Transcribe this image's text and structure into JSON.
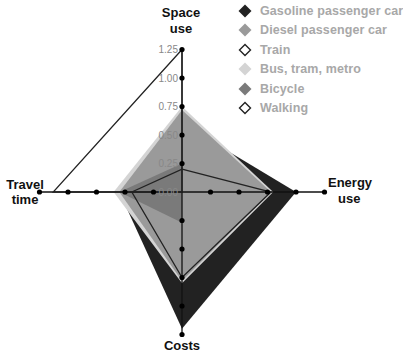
{
  "chart_data": {
    "type": "radar",
    "title": "",
    "axes": [
      "Space use",
      "Energy use",
      "Costs",
      "Travel time"
    ],
    "axis_labels": {
      "space": [
        "Space",
        "use"
      ],
      "energy": [
        "Energy",
        "use"
      ],
      "costs": [
        "Costs"
      ],
      "travel": [
        "Travel",
        "time"
      ]
    },
    "ticks": [
      "0.00",
      "0.25",
      "0.50",
      "0.75",
      "1.00",
      "1.25"
    ],
    "range": [
      0,
      1.25
    ],
    "series": [
      {
        "name": "Gasoline passenger car",
        "style": "filled",
        "color": "#222222",
        "values": {
          "space": 0.6,
          "energy": 1.0,
          "costs": 1.2,
          "travel": 0.55
        }
      },
      {
        "name": "Diesel passenger car",
        "style": "filled",
        "color": "#9a9a9a",
        "values": {
          "space": 0.72,
          "energy": 0.78,
          "costs": 0.78,
          "travel": 0.55
        }
      },
      {
        "name": "Train",
        "style": "outline",
        "color": "#222222",
        "values": {
          "space": 0.2,
          "energy": 0.78,
          "costs": 0.75,
          "travel": 0.44
        }
      },
      {
        "name": "Bus, tram, metro",
        "style": "filled",
        "color": "#d4d4d4",
        "values": {
          "space": 0.75,
          "energy": 0.8,
          "costs": 0.8,
          "travel": 0.6
        }
      },
      {
        "name": "Bicycle",
        "style": "filled",
        "color": "#7a7a7a",
        "values": {
          "space": 0.25,
          "energy": 0.0,
          "costs": 0.27,
          "travel": 0.55
        }
      },
      {
        "name": "Walking",
        "style": "outline",
        "color": "#222222",
        "values": {
          "space": 1.25,
          "energy": 0.0,
          "costs": 0.0,
          "travel": 1.13
        }
      }
    ]
  },
  "legend": {
    "items": [
      {
        "label": "Gasoline passenger car",
        "marker": "filled-diamond",
        "color": "#222222"
      },
      {
        "label": "Diesel passenger car",
        "marker": "filled-diamond",
        "color": "#9a9a9a"
      },
      {
        "label": "Train",
        "marker": "outline-diamond",
        "color": "#222222"
      },
      {
        "label": "Bus, tram, metro",
        "marker": "filled-diamond",
        "color": "#d4d4d4"
      },
      {
        "label": "Bicycle",
        "marker": "filled-diamond",
        "color": "#7a7a7a"
      },
      {
        "label": "Walking",
        "marker": "outline-diamond",
        "color": "#222222"
      }
    ]
  }
}
